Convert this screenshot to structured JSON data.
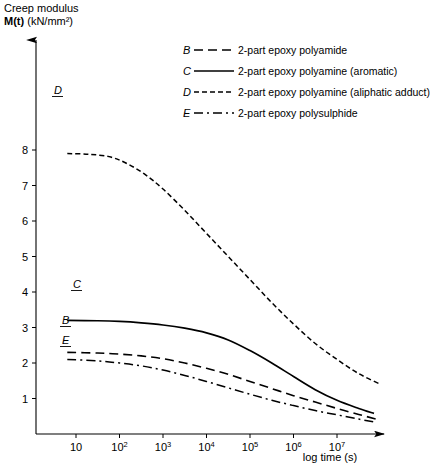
{
  "chart_data": {
    "type": "line",
    "title": "",
    "ylabel": "Creep modulus M(t) (kN/mm²)",
    "ylabel_line1": "Creep modulus",
    "ylabel_line2_bold": "M(t)",
    "ylabel_line2_units": "(kN/mm²)",
    "xlabel": "log time (s)",
    "xtick_labels": [
      "10",
      "10",
      "10",
      "10",
      "10",
      "10",
      "10"
    ],
    "xtick_exponents": [
      "",
      "2",
      "3",
      "4",
      "5",
      "6",
      "7"
    ],
    "x": [
      1,
      2,
      3,
      4,
      5,
      6,
      7
    ],
    "xlim": [
      0.2,
      8.0
    ],
    "ytick_labels": [
      "1",
      "2",
      "3",
      "4",
      "5",
      "6",
      "7",
      "8"
    ],
    "ylim": [
      0,
      8.6
    ],
    "grid": false,
    "legend_position": "top-right",
    "series": [
      {
        "name": "B",
        "key": "B",
        "label": "2-part epoxy polyamide",
        "style": "dashed",
        "dasharray": "9,5",
        "width": 1.6,
        "x": [
          0.8,
          1.5,
          2.0,
          2.5,
          3.0,
          3.5,
          4.0,
          4.5,
          5.0,
          5.5,
          6.0,
          6.5,
          7.0,
          7.5,
          7.9
        ],
        "values": [
          2.3,
          2.28,
          2.25,
          2.2,
          2.12,
          2.0,
          1.85,
          1.68,
          1.48,
          1.28,
          1.08,
          0.9,
          0.72,
          0.55,
          0.42
        ]
      },
      {
        "name": "C",
        "key": "C",
        "label": "2-part epoxy polyamine (aromatic)",
        "style": "solid",
        "dasharray": "none",
        "width": 1.7,
        "x": [
          0.8,
          1.5,
          2.0,
          2.5,
          3.0,
          3.5,
          4.0,
          4.5,
          5.0,
          5.5,
          6.0,
          6.5,
          7.0,
          7.5,
          7.85
        ],
        "values": [
          3.2,
          3.19,
          3.17,
          3.13,
          3.07,
          2.98,
          2.85,
          2.65,
          2.35,
          2.0,
          1.62,
          1.25,
          0.95,
          0.72,
          0.58
        ]
      },
      {
        "name": "D",
        "key": "D",
        "label": "2-part epoxy polyamine (aliphatic adduct)",
        "style": "dotted-dash",
        "dasharray": "5,3",
        "width": 1.5,
        "x": [
          0.8,
          1.3,
          1.8,
          2.2,
          2.6,
          3.0,
          3.5,
          4.0,
          4.5,
          5.0,
          5.5,
          6.0,
          6.5,
          7.0,
          7.5,
          8.0
        ],
        "values": [
          7.9,
          7.88,
          7.8,
          7.6,
          7.3,
          6.9,
          6.3,
          5.65,
          5.0,
          4.35,
          3.7,
          3.1,
          2.55,
          2.1,
          1.7,
          1.4
        ]
      },
      {
        "name": "E",
        "key": "E",
        "label": "2-part epoxy polysulphide",
        "style": "dash-dot",
        "dasharray": "9,4,2,4",
        "width": 1.5,
        "x": [
          0.8,
          1.5,
          2.0,
          2.5,
          3.0,
          3.5,
          4.0,
          4.5,
          5.0,
          5.5,
          6.0,
          6.5,
          7.0,
          7.5,
          7.9
        ],
        "values": [
          2.1,
          2.06,
          2.0,
          1.92,
          1.8,
          1.65,
          1.48,
          1.3,
          1.12,
          0.95,
          0.8,
          0.66,
          0.54,
          0.42,
          0.33
        ]
      }
    ],
    "curve_labels": [
      {
        "key": "D",
        "x": 54,
        "y": 94
      },
      {
        "key": "C",
        "x": 73,
        "y": 288
      },
      {
        "key": "B",
        "x": 62,
        "y": 324
      },
      {
        "key": "E",
        "x": 62,
        "y": 344
      }
    ]
  }
}
